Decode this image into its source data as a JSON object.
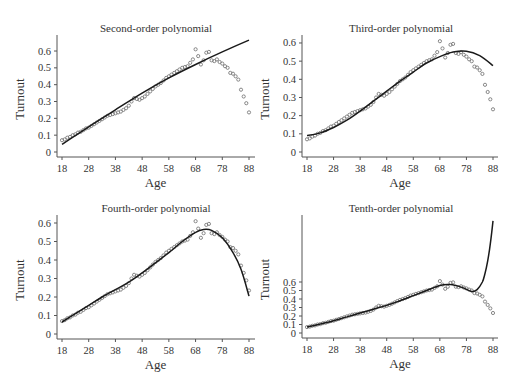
{
  "chart_data": [
    {
      "type": "scatter",
      "title": "Second-order polynomial",
      "xlabel": "Age",
      "ylabel": "Turnout",
      "xticks": [
        18,
        28,
        38,
        48,
        58,
        68,
        78,
        88
      ],
      "yticks": [
        0,
        0.1,
        0.2,
        0.3,
        0.4,
        0.5,
        0.6
      ],
      "xlim": [
        18,
        88
      ],
      "ylim": [
        0,
        0.66
      ],
      "fit": {
        "name": "Second-order polynomial fit",
        "x": [
          18,
          28,
          38,
          48,
          58,
          68,
          78,
          88
        ],
        "y": [
          0.045,
          0.15,
          0.25,
          0.35,
          0.44,
          0.52,
          0.595,
          0.665
        ]
      }
    },
    {
      "type": "scatter",
      "title": "Third-order polynomial",
      "xlabel": "Age",
      "ylabel": "Turnout",
      "xticks": [
        18,
        28,
        38,
        48,
        58,
        68,
        78,
        88
      ],
      "yticks": [
        0,
        0.1,
        0.2,
        0.3,
        0.4,
        0.5,
        0.6
      ],
      "xlim": [
        18,
        88
      ],
      "ylim": [
        0,
        0.62
      ],
      "fit": {
        "name": "Third-order polynomial fit",
        "x": [
          18,
          23,
          28,
          33,
          38,
          43,
          48,
          53,
          58,
          63,
          68,
          73,
          78,
          83,
          88
        ],
        "y": [
          0.09,
          0.105,
          0.135,
          0.175,
          0.225,
          0.28,
          0.335,
          0.39,
          0.44,
          0.49,
          0.525,
          0.55,
          0.555,
          0.53,
          0.475
        ]
      }
    },
    {
      "type": "scatter",
      "title": "Fourth-order polynomial",
      "xlabel": "Age",
      "ylabel": "Turnout",
      "xticks": [
        18,
        28,
        38,
        48,
        58,
        68,
        78,
        88
      ],
      "yticks": [
        0,
        0.1,
        0.2,
        0.3,
        0.4,
        0.5,
        0.6
      ],
      "xlim": [
        18,
        88
      ],
      "ylim": [
        0,
        0.63
      ],
      "fit": {
        "name": "Fourth-order polynomial fit",
        "x": [
          18,
          23,
          28,
          33,
          38,
          43,
          48,
          53,
          58,
          63,
          68,
          71,
          74,
          78,
          82,
          85,
          88
        ],
        "y": [
          0.065,
          0.11,
          0.155,
          0.2,
          0.24,
          0.28,
          0.33,
          0.385,
          0.44,
          0.5,
          0.55,
          0.565,
          0.56,
          0.52,
          0.44,
          0.35,
          0.205
        ]
      }
    },
    {
      "type": "scatter",
      "title": "Tenth-order polynomial",
      "xlabel": "Age",
      "ylabel": "Turnout",
      "xticks": [
        18,
        28,
        38,
        48,
        58,
        68,
        78,
        88
      ],
      "yticks": [
        0,
        0.1,
        0.2,
        0.3,
        0.4,
        0.5,
        0.6
      ],
      "xlim": [
        18,
        88
      ],
      "ylim": [
        0,
        1.4
      ],
      "fit": {
        "name": "Tenth-order polynomial fit",
        "x": [
          18,
          23,
          28,
          33,
          38,
          43,
          48,
          53,
          58,
          63,
          68,
          72,
          76,
          80,
          82,
          84,
          85,
          86,
          87,
          88
        ],
        "y": [
          0.07,
          0.105,
          0.145,
          0.19,
          0.235,
          0.28,
          0.325,
          0.38,
          0.44,
          0.5,
          0.56,
          0.57,
          0.54,
          0.49,
          0.51,
          0.6,
          0.7,
          0.85,
          1.05,
          1.32
        ]
      }
    }
  ],
  "observed": {
    "name": "Turnout by age (observed)",
    "x": [
      18,
      19,
      20,
      21,
      22,
      23,
      24,
      25,
      26,
      27,
      28,
      29,
      30,
      31,
      32,
      33,
      34,
      35,
      36,
      37,
      38,
      39,
      40,
      41,
      42,
      43,
      44,
      45,
      46,
      47,
      48,
      49,
      50,
      51,
      52,
      53,
      54,
      55,
      56,
      57,
      58,
      59,
      60,
      61,
      62,
      63,
      64,
      65,
      66,
      67,
      68,
      69,
      70,
      71,
      72,
      73,
      74,
      75,
      76,
      77,
      78,
      79,
      80,
      81,
      82,
      83,
      84,
      85,
      86,
      87,
      88
    ],
    "y": [
      0.07,
      0.075,
      0.085,
      0.09,
      0.1,
      0.105,
      0.115,
      0.12,
      0.13,
      0.14,
      0.145,
      0.155,
      0.165,
      0.175,
      0.185,
      0.195,
      0.205,
      0.215,
      0.22,
      0.225,
      0.23,
      0.235,
      0.24,
      0.25,
      0.26,
      0.275,
      0.3,
      0.32,
      0.315,
      0.31,
      0.32,
      0.33,
      0.345,
      0.36,
      0.375,
      0.39,
      0.4,
      0.41,
      0.425,
      0.44,
      0.45,
      0.46,
      0.47,
      0.48,
      0.49,
      0.5,
      0.505,
      0.51,
      0.53,
      0.55,
      0.61,
      0.57,
      0.52,
      0.545,
      0.59,
      0.595,
      0.545,
      0.54,
      0.55,
      0.535,
      0.525,
      0.51,
      0.5,
      0.47,
      0.465,
      0.45,
      0.43,
      0.37,
      0.33,
      0.29,
      0.235
    ]
  },
  "colors": {
    "fit_line": "#1a1a1a",
    "observed_points": "#7a7a7a",
    "axis": "#555555",
    "text": "#333333"
  }
}
